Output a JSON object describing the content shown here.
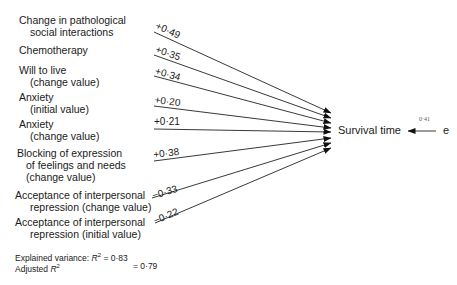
{
  "diagram": {
    "type": "path-diagram",
    "outcome": "Survival time",
    "error_term": "e",
    "error_coefficient": "0·41",
    "predictors": [
      {
        "label_lines": [
          "Change in pathological",
          "social interactions"
        ],
        "coefficient": "+0·49"
      },
      {
        "label_lines": [
          "Chemotherapy"
        ],
        "coefficient": "+0·35"
      },
      {
        "label_lines": [
          "Will to live",
          "(change value)"
        ],
        "coefficient": "+0·34"
      },
      {
        "label_lines": [
          "Anxiety",
          "(initial value)"
        ],
        "coefficient": "+0·20"
      },
      {
        "label_lines": [
          "Anxiety",
          "(change value)"
        ],
        "coefficient": "+0·21"
      },
      {
        "label_lines": [
          "Blocking of expression",
          "of feelings and needs",
          "(change value)"
        ],
        "coefficient": "+0·38"
      },
      {
        "label_lines": [
          "Acceptance of interpersonal",
          "repression (change value)"
        ],
        "coefficient": "−0·33"
      },
      {
        "label_lines": [
          "Acceptance of interpersonal",
          "repression (initial value)"
        ],
        "coefficient": "−0·22"
      }
    ],
    "stats": {
      "explained_label": "Explained variance:",
      "r2_symbol": "R",
      "r2_sup": "2",
      "r2_value": "= 0·83",
      "adjusted_label": "Adjusted",
      "adj_value": "= 0·79"
    }
  }
}
